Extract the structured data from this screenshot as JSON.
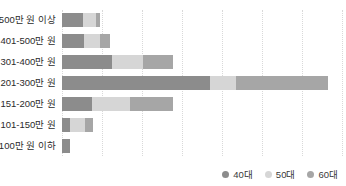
{
  "chart_data": {
    "type": "bar",
    "orientation": "horizontal",
    "stacked": true,
    "title": "",
    "subtitle": "",
    "xlabel": "",
    "ylabel": "",
    "grid": true,
    "gridlines_x": [
      0,
      40,
      80,
      120,
      160,
      200,
      240,
      280
    ],
    "xlim": [
      0,
      280
    ],
    "legend_position": "bottom-right",
    "categories": [
      "500만 원 이상",
      "401-500만 원",
      "301-400만 원",
      "201-300만 원",
      "151-200만 원",
      "101-150만 원",
      "100만 원 이하"
    ],
    "series": [
      {
        "name": "40대",
        "color": "#8c8c8c",
        "values": [
          21,
          22,
          50,
          148,
          30,
          8,
          8
        ]
      },
      {
        "name": "50대",
        "color": "#d6d6d6",
        "values": [
          13,
          16,
          31,
          26,
          38,
          15,
          0
        ]
      },
      {
        "name": "60대",
        "color": "#a6a6a6",
        "values": [
          4,
          10,
          30,
          92,
          43,
          8,
          0
        ]
      }
    ]
  },
  "legend": {
    "items": [
      {
        "label": "40대",
        "color": "#8c8c8c"
      },
      {
        "label": "50대",
        "color": "#d6d6d6"
      },
      {
        "label": "60대",
        "color": "#a6a6a6"
      }
    ]
  },
  "axis": {
    "gridline_color": "#d9d9d9"
  }
}
